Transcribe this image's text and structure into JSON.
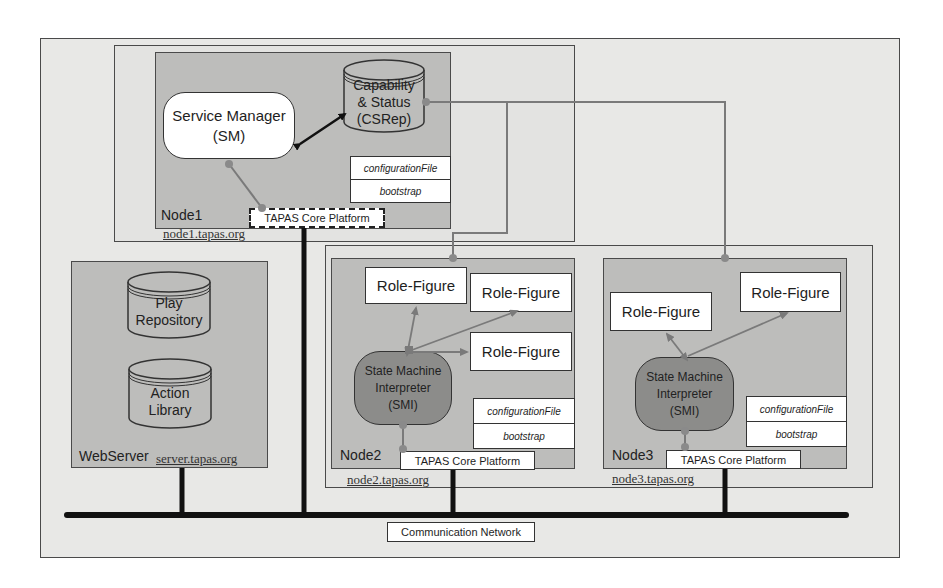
{
  "diagram": {
    "node1": {
      "label": "Node1",
      "host": "node1.tapas.org",
      "service_manager": "Service Manager\n(SM)",
      "service_manager_line1": "Service Manager",
      "service_manager_line2": "(SM)",
      "csrep_line1": "Capability",
      "csrep_line2": "& Status",
      "csrep_line3": "(CSRep)",
      "config_file": "configurationFile",
      "bootstrap": "bootstrap",
      "platform": "TAPAS Core Platform"
    },
    "webserver": {
      "label": "WebServer",
      "host": "server.tapas.org",
      "play_repo_line1": "Play",
      "play_repo_line2": "Repository",
      "action_lib_line1": "Action",
      "action_lib_line2": "Library"
    },
    "node2": {
      "label": "Node2",
      "host": "node2.tapas.org",
      "role_figures": [
        "Role-Figure",
        "Role-Figure",
        "Role-Figure"
      ],
      "smi_line1": "State Machine",
      "smi_line2": "Interpreter",
      "smi_line3": "(SMI)",
      "config_file": "configurationFile",
      "bootstrap": "bootstrap",
      "platform": "TAPAS Core Platform"
    },
    "node3": {
      "label": "Node3",
      "host": "node3.tapas.org",
      "role_figures": [
        "Role-Figure",
        "Role-Figure"
      ],
      "smi_line1": "State Machine",
      "smi_line2": "Interpreter",
      "smi_line3": "(SMI)",
      "config_file": "configurationFile",
      "bootstrap": "bootstrap",
      "platform": "TAPAS Core Platform"
    },
    "network": {
      "label": "Communication Network"
    }
  }
}
